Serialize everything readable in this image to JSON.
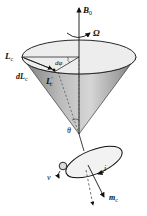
{
  "diagram": {
    "type": "larmor-precession-cone",
    "labels": {
      "field": "B",
      "field_sub": "0",
      "precession": "Ω",
      "angular_momentum": "L",
      "angular_momentum_sub": "c",
      "d_angular_momentum": "dL",
      "d_angular_momentum_sub": "c",
      "new_angular_momentum": "L",
      "new_angular_momentum_sub": "c",
      "new_angular_momentum_prime": "′",
      "azimuth_angle": "dφ",
      "cone_angle": "θ",
      "velocity": "v",
      "current": "i",
      "magnetic_moment": "m",
      "magnetic_moment_sub": "c"
    },
    "colors": {
      "cone_light": "#e6e6e6",
      "cone_dark": "#8a8a8a",
      "top_ellipse": "#ececec",
      "lines": "#111111"
    }
  }
}
